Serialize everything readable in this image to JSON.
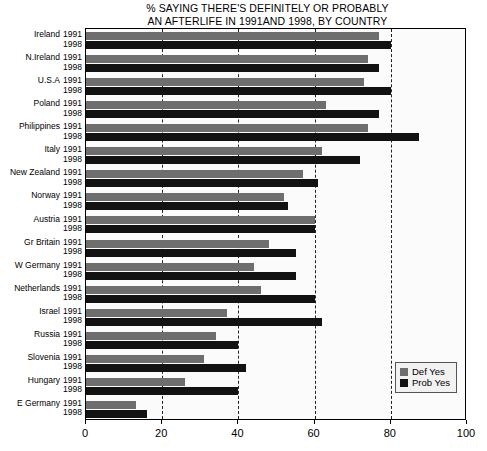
{
  "chart_data": {
    "type": "bar",
    "title": "% SAYING THERE'S DEFINITELY OR PROBABLY AN AFTERLIFE IN 1991AND 1998, BY COUNTRY",
    "title_lines": [
      "% SAYING THERE'S DEFINITELY OR PROBABLY",
      "AN AFTERLIFE IN 1991AND 1998, BY COUNTRY"
    ],
    "orientation": "horizontal",
    "xlabel": "",
    "ylabel": "",
    "xlim": [
      0,
      100
    ],
    "xticks": [
      0,
      20,
      40,
      60,
      80,
      100
    ],
    "xtick_labels": [
      "0",
      "20",
      "40",
      "60",
      "80",
      "100"
    ],
    "grid": "vertical-dashed",
    "legend_position": "bottom-right",
    "colors": {
      "def_yes": "#6e6e6e",
      "prob_yes": "#121212"
    },
    "series": [
      {
        "name": "Def Yes",
        "year": "1991",
        "color": "#6e6e6e",
        "values": [
          77,
          74,
          73,
          63,
          74,
          62,
          57,
          52,
          60,
          48,
          44,
          46,
          37,
          34,
          31,
          26,
          13
        ]
      },
      {
        "name": "Prob Yes",
        "year": "1998",
        "color": "#121212",
        "values": [
          80,
          77,
          80,
          77,
          87.5,
          72,
          61,
          53,
          60,
          55,
          55,
          60,
          62,
          40,
          42,
          40,
          16
        ]
      }
    ],
    "categories": [
      "Ireland",
      "N.Ireland",
      "U.S.A",
      "Poland",
      "Philippines",
      "Italy",
      "New Zealand",
      "Norway",
      "Austria",
      "Gr Britain",
      "W Germany",
      "Netherlands",
      "Israel",
      "Russia",
      "Slovenia",
      "Hungary",
      "E Germany"
    ],
    "year_labels": [
      "1991",
      "1998"
    ]
  },
  "legend": {
    "items": [
      {
        "label": "Def Yes",
        "color": "#6e6e6e"
      },
      {
        "label": "Prob Yes",
        "color": "#121212"
      }
    ]
  }
}
